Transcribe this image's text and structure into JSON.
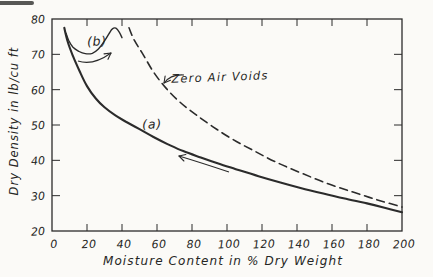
{
  "figure": {
    "background": "#fbfaf7",
    "ink": "#2b2b2b"
  },
  "chart_data": {
    "type": "line",
    "title": "",
    "xlabel": "Moisture Content in % Dry Weight",
    "ylabel": "Dry Density in lb/cu ft",
    "xlim": [
      0,
      200
    ],
    "ylim": [
      20,
      80
    ],
    "grid": false,
    "frame": true,
    "legend_position": "none (inline annotations)",
    "x_ticks": [
      0,
      20,
      40,
      60,
      80,
      100,
      120,
      140,
      160,
      180,
      200
    ],
    "x_tick_labels": [
      "0",
      "20",
      "40",
      "60",
      "80",
      "100",
      "120",
      "140",
      "160",
      "180",
      "200"
    ],
    "y_ticks": [
      20,
      30,
      40,
      50,
      60,
      70,
      80
    ],
    "y_tick_labels": [
      "20",
      "30",
      "40",
      "50",
      "60",
      "70",
      "80"
    ],
    "series": [
      {
        "name": "curve-a-drying",
        "label": "(a)",
        "style": "solid",
        "points": [
          [
            7,
            77.5
          ],
          [
            9,
            73.5
          ],
          [
            12,
            69.5
          ],
          [
            16,
            65
          ],
          [
            20,
            61
          ],
          [
            25,
            57.5
          ],
          [
            30,
            55
          ],
          [
            36,
            52.8
          ],
          [
            42,
            51
          ],
          [
            50,
            48.8
          ],
          [
            58,
            46.6
          ],
          [
            66,
            44.6
          ],
          [
            75,
            42.6
          ],
          [
            85,
            40.8
          ],
          [
            95,
            39.1
          ],
          [
            105,
            37.5
          ],
          [
            118,
            35.5
          ],
          [
            130,
            33.8
          ],
          [
            142,
            32.2
          ],
          [
            155,
            30.6
          ],
          [
            168,
            29.1
          ],
          [
            180,
            27.8
          ],
          [
            190,
            26.6
          ],
          [
            200,
            25.3
          ]
        ]
      },
      {
        "name": "curve-b-compaction",
        "label": "(b)",
        "style": "solid",
        "points": [
          [
            8,
            76
          ],
          [
            9.5,
            74
          ],
          [
            12,
            72
          ],
          [
            15.5,
            70.8
          ],
          [
            19,
            70.2
          ],
          [
            23,
            70.3
          ],
          [
            26.5,
            71.5
          ],
          [
            30,
            73.8
          ],
          [
            32.5,
            75.8
          ],
          [
            34.5,
            77.2
          ],
          [
            36.5,
            77.4
          ],
          [
            38.5,
            76.2
          ],
          [
            40,
            74.7
          ]
        ]
      },
      {
        "name": "zero-air-voids",
        "label": "Zero Air Voids",
        "style": "dashed",
        "points": [
          [
            44,
            77.5
          ],
          [
            47,
            74
          ],
          [
            52,
            70
          ],
          [
            58,
            65
          ],
          [
            65,
            60.5
          ],
          [
            73,
            56.5
          ],
          [
            82,
            53
          ],
          [
            92,
            49.5
          ],
          [
            103,
            46
          ],
          [
            115,
            42.8
          ],
          [
            128,
            39.5
          ],
          [
            142,
            36.5
          ],
          [
            157,
            33.5
          ],
          [
            172,
            31
          ],
          [
            186,
            28.8
          ],
          [
            200,
            26.8
          ]
        ]
      }
    ],
    "annotations": [
      {
        "text": "(a)",
        "target": "curve-a-drying"
      },
      {
        "text": "(b)",
        "target": "curve-b-compaction"
      },
      {
        "text": "Zero Air Voids",
        "target": "zero-air-voids"
      }
    ],
    "arrows": [
      {
        "name": "direction-arrow-b",
        "from": [
          78,
          61
        ],
        "ctrl": [
          93,
          66
        ],
        "to": [
          111,
          53
        ]
      },
      {
        "name": "direction-arrow-a",
        "from": [
          229,
          172
        ],
        "ctrl": [
          202,
          163
        ],
        "to": [
          179,
          156
        ]
      },
      {
        "name": "zero-air-voids-leader",
        "from": [
          184,
          75
        ],
        "ctrl": [
          171,
          74
        ],
        "to": [
          164,
          83
        ]
      }
    ]
  }
}
